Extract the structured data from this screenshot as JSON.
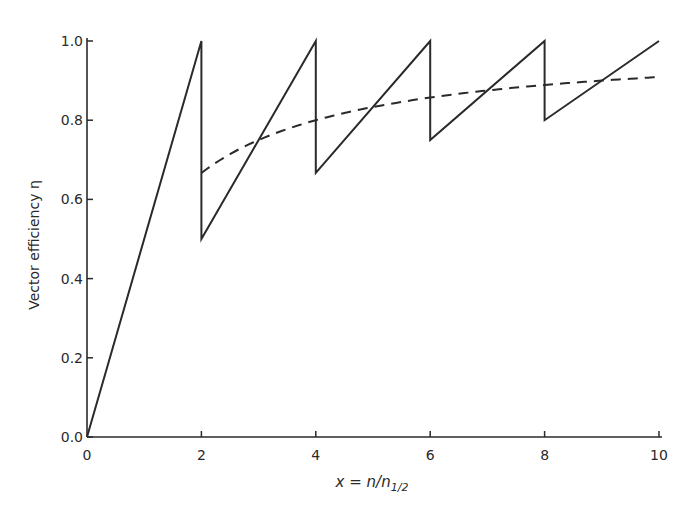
{
  "chart_data": {
    "type": "line",
    "title": "",
    "xlabel": "x = n/n",
    "xlabel_sub": "1/2",
    "ylabel": "Vector efficiency η",
    "xlim": [
      0,
      10
    ],
    "ylim": [
      0,
      1.0
    ],
    "x_ticks": [
      "0",
      "2",
      "4",
      "6",
      "8",
      "10"
    ],
    "x_tick_values": [
      0,
      2,
      4,
      6,
      8,
      10
    ],
    "y_ticks": [
      "0.0",
      "0.2",
      "0.4",
      "0.6",
      "0.8",
      "1.0"
    ],
    "y_tick_values": [
      0,
      0.2,
      0.4,
      0.6,
      0.8,
      1.0
    ],
    "grid": false,
    "legend": null,
    "series": [
      {
        "name": "sawtooth (solid)",
        "style": "solid",
        "points": [
          [
            0,
            0
          ],
          [
            2,
            1.0
          ],
          [
            2,
            0.5
          ],
          [
            4,
            1.0
          ],
          [
            4,
            0.667
          ],
          [
            6,
            1.0
          ],
          [
            6,
            0.75
          ],
          [
            8,
            1.0
          ],
          [
            8,
            0.8
          ],
          [
            10,
            1.0
          ]
        ]
      },
      {
        "name": "smooth x/(1+x) (dashed)",
        "style": "dashed",
        "points": [
          [
            2,
            0.667
          ],
          [
            3,
            0.75
          ],
          [
            4,
            0.8
          ],
          [
            5,
            0.833
          ],
          [
            6,
            0.857
          ],
          [
            7,
            0.875
          ],
          [
            8,
            0.889
          ],
          [
            9,
            0.9
          ],
          [
            10,
            0.909
          ]
        ]
      }
    ]
  }
}
